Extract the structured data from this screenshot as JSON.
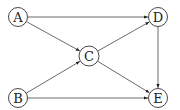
{
  "diagram": {
    "type": "directed-graph",
    "nodes": [
      {
        "id": "A",
        "label": "A",
        "x": 18,
        "y": 17,
        "r": 9.5
      },
      {
        "id": "B",
        "label": "B",
        "x": 18,
        "y": 98,
        "r": 9.5
      },
      {
        "id": "C",
        "label": "C",
        "x": 89,
        "y": 56,
        "r": 10
      },
      {
        "id": "D",
        "label": "D",
        "x": 158,
        "y": 17,
        "r": 9.5
      },
      {
        "id": "E",
        "label": "E",
        "x": 158,
        "y": 98,
        "r": 9.5
      }
    ],
    "edges": [
      {
        "from": "A",
        "to": "D"
      },
      {
        "from": "A",
        "to": "C"
      },
      {
        "from": "B",
        "to": "C"
      },
      {
        "from": "B",
        "to": "E"
      },
      {
        "from": "C",
        "to": "D"
      },
      {
        "from": "C",
        "to": "E"
      },
      {
        "from": "D",
        "to": "E"
      }
    ],
    "colors": {
      "stroke": "#333333",
      "edge": "#444444",
      "background": "#ffffff"
    }
  }
}
